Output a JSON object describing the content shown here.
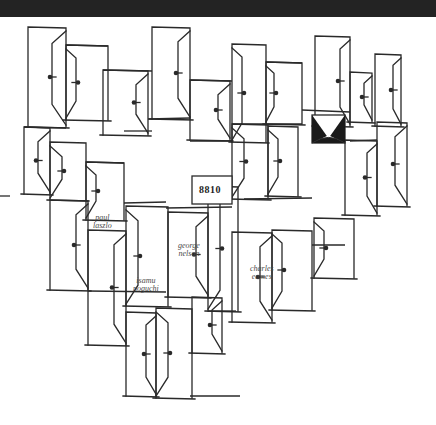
{
  "artwork": {
    "background": "#ffffff",
    "ink": "#2a2a2a",
    "top_band_color": "#232323",
    "code_label": "8810",
    "names": [
      {
        "line1": "paul",
        "line2": "laszlo",
        "x": 93,
        "y": 214
      },
      {
        "line1": "george",
        "line2": "nelson",
        "x": 178,
        "y": 242
      },
      {
        "line1": "isamu",
        "line2": "noguchi",
        "x": 133,
        "y": 277
      },
      {
        "line1": "charles",
        "line2": "eames",
        "x": 250,
        "y": 265
      }
    ],
    "doors": [
      {
        "x": 28,
        "y": 27,
        "w": 38,
        "h": 100,
        "open": -14
      },
      {
        "x": 66,
        "y": 45,
        "w": 42,
        "h": 75,
        "open": 10
      },
      {
        "x": 103,
        "y": 70,
        "w": 45,
        "h": 65,
        "open": -12
      },
      {
        "x": 152,
        "y": 27,
        "w": 38,
        "h": 92,
        "open": -12
      },
      {
        "x": 190,
        "y": 80,
        "w": 40,
        "h": 60,
        "open": -12
      },
      {
        "x": 232,
        "y": 44,
        "w": 34,
        "h": 98,
        "open": 10
      },
      {
        "x": 266,
        "y": 62,
        "w": 36,
        "h": 62,
        "open": 8
      },
      {
        "x": 315,
        "y": 36,
        "w": 35,
        "h": 90,
        "open": -10
      },
      {
        "x": 350,
        "y": 72,
        "w": 22,
        "h": 50,
        "open": -8
      },
      {
        "x": 375,
        "y": 54,
        "w": 26,
        "h": 72,
        "open": -8
      },
      {
        "x": 24,
        "y": 127,
        "w": 26,
        "h": 67,
        "open": -12
      },
      {
        "x": 50,
        "y": 142,
        "w": 36,
        "h": 58,
        "open": 12
      },
      {
        "x": 86,
        "y": 162,
        "w": 38,
        "h": 58,
        "open": 10
      },
      {
        "x": 232,
        "y": 124,
        "w": 36,
        "h": 75,
        "open": 12
      },
      {
        "x": 268,
        "y": 126,
        "w": 30,
        "h": 70,
        "open": 10
      },
      {
        "x": 345,
        "y": 140,
        "w": 32,
        "h": 75,
        "open": -10
      },
      {
        "x": 377,
        "y": 122,
        "w": 30,
        "h": 84,
        "open": -12
      },
      {
        "x": 50,
        "y": 200,
        "w": 38,
        "h": 90,
        "open": -12
      },
      {
        "x": 88,
        "y": 230,
        "w": 38,
        "h": 115,
        "open": -12
      },
      {
        "x": 126,
        "y": 206,
        "w": 42,
        "h": 100,
        "open": 12
      },
      {
        "x": 168,
        "y": 212,
        "w": 40,
        "h": 85,
        "open": -12
      },
      {
        "x": 208,
        "y": 186,
        "w": 30,
        "h": 125,
        "open": 12
      },
      {
        "x": 232,
        "y": 232,
        "w": 40,
        "h": 90,
        "open": -12
      },
      {
        "x": 272,
        "y": 230,
        "w": 40,
        "h": 80,
        "open": 10
      },
      {
        "x": 314,
        "y": 218,
        "w": 40,
        "h": 60,
        "open": 10
      },
      {
        "x": 126,
        "y": 312,
        "w": 30,
        "h": 84,
        "open": -10
      },
      {
        "x": 156,
        "y": 308,
        "w": 36,
        "h": 90,
        "open": 12
      },
      {
        "x": 192,
        "y": 297,
        "w": 30,
        "h": 56,
        "open": -10
      }
    ],
    "lines": [
      [
        66,
        45,
        108,
        46
      ],
      [
        103,
        70,
        152,
        71
      ],
      [
        190,
        80,
        232,
        81
      ],
      [
        266,
        62,
        302,
        63
      ],
      [
        24,
        127,
        66,
        128
      ],
      [
        86,
        162,
        124,
        163
      ],
      [
        124,
        131,
        152,
        131
      ],
      [
        148,
        119,
        190,
        118
      ],
      [
        190,
        141,
        232,
        141
      ],
      [
        232,
        124,
        302,
        124
      ],
      [
        302,
        110,
        350,
        112
      ],
      [
        350,
        141,
        377,
        140
      ],
      [
        124,
        203,
        166,
        202
      ],
      [
        166,
        208,
        232,
        207
      ],
      [
        244,
        199,
        312,
        198
      ],
      [
        88,
        291,
        166,
        292
      ],
      [
        312,
        245,
        345,
        245
      ],
      [
        0,
        196,
        10,
        196
      ],
      [
        208,
        311,
        236,
        311
      ],
      [
        190,
        396,
        240,
        396
      ]
    ],
    "code_box": {
      "x": 192,
      "y": 176,
      "w": 40,
      "h": 28
    },
    "bow": {
      "x": 312,
      "y": 115,
      "w": 33,
      "h": 28
    }
  }
}
